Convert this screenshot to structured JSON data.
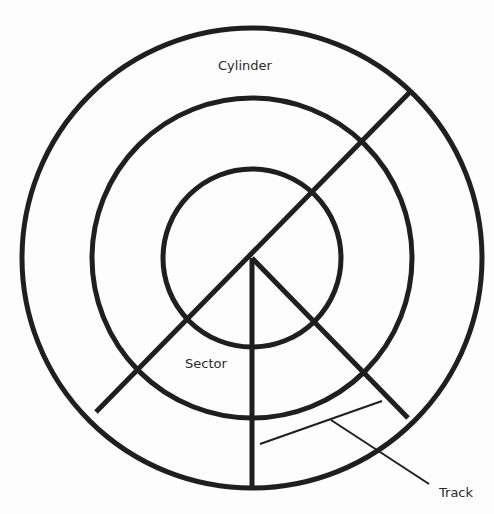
{
  "diagram": {
    "labels": {
      "cylinder": "Cylinder",
      "sector": "Sector",
      "track": "Track"
    },
    "center": [
      252,
      258
    ],
    "circles": [
      {
        "name": "outer-platter",
        "r": 230
      },
      {
        "name": "middle-track-ring",
        "r": 160
      },
      {
        "name": "inner-track-ring",
        "r": 89
      }
    ],
    "colors": {
      "stroke": "#1f1f1f",
      "text": "#2a2a2a",
      "background": "#fdfdfd"
    }
  }
}
